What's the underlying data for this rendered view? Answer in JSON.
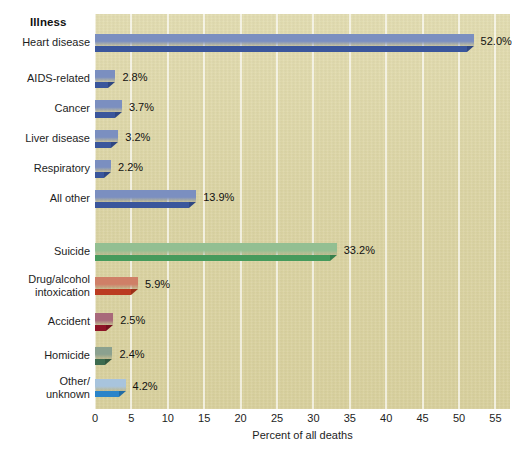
{
  "chart_data": {
    "type": "bar",
    "orientation": "horizontal",
    "title": "",
    "group_header": "Illness",
    "xlabel": "Percent of all deaths",
    "ylabel": "",
    "xlim": [
      0,
      57
    ],
    "xticks": [
      0,
      5,
      10,
      15,
      20,
      25,
      30,
      35,
      40,
      45,
      50,
      55
    ],
    "xtick_labels": [
      "0",
      "5",
      "10",
      "15",
      "20",
      "25",
      "30",
      "35",
      "40",
      "45",
      "50",
      "55"
    ],
    "grid": "vertical",
    "legend": "none",
    "categories": [
      "Heart disease",
      "AIDS-related",
      "Cancer",
      "Liver disease",
      "Respiratory",
      "All other",
      "Suicide",
      "Drug/alcohol intoxication",
      "Accident",
      "Homicide",
      "Other/ unknown"
    ],
    "values": [
      52.0,
      2.8,
      3.7,
      3.2,
      2.2,
      13.9,
      33.2,
      5.9,
      2.5,
      2.4,
      4.2
    ],
    "value_labels": [
      "52.0%",
      "2.8%",
      "3.7%",
      "3.2%",
      "2.2%",
      "13.9%",
      "33.2%",
      "5.9%",
      "2.5%",
      "2.4%",
      "4.2%"
    ],
    "bars": [
      {
        "label": "Heart disease",
        "label_lines": [
          "Heart disease"
        ],
        "value": 52.0,
        "value_label": "52.0%",
        "top_color": "#7b8fc0",
        "front_color": "#3a569c",
        "side_color": "#2f4782",
        "y": 34
      },
      {
        "label": "AIDS-related",
        "label_lines": [
          "AIDS-related"
        ],
        "value": 2.8,
        "value_label": "2.8%",
        "top_color": "#7b8fc0",
        "front_color": "#3a569c",
        "side_color": "#2f4782",
        "y": 70
      },
      {
        "label": "Cancer",
        "label_lines": [
          "Cancer"
        ],
        "value": 3.7,
        "value_label": "3.7%",
        "top_color": "#7b8fc0",
        "front_color": "#3a569c",
        "side_color": "#2f4782",
        "y": 100
      },
      {
        "label": "Liver disease",
        "label_lines": [
          "Liver disease"
        ],
        "value": 3.2,
        "value_label": "3.2%",
        "top_color": "#7b8fc0",
        "front_color": "#3a569c",
        "side_color": "#2f4782",
        "y": 130
      },
      {
        "label": "Respiratory",
        "label_lines": [
          "Respiratory"
        ],
        "value": 2.2,
        "value_label": "2.2%",
        "top_color": "#7b8fc0",
        "front_color": "#3a569c",
        "side_color": "#2f4782",
        "y": 160
      },
      {
        "label": "All other",
        "label_lines": [
          "All other"
        ],
        "value": 13.9,
        "value_label": "13.9%",
        "top_color": "#7b8fc0",
        "front_color": "#3a569c",
        "side_color": "#2f4782",
        "y": 190
      },
      {
        "label": "Suicide",
        "label_lines": [
          "Suicide"
        ],
        "value": 33.2,
        "value_label": "33.2%",
        "top_color": "#93bf92",
        "front_color": "#469a5c",
        "side_color": "#37804c",
        "y": 243
      },
      {
        "label": "Drug/alcohol intoxication",
        "label_lines": [
          "Drug/alcohol",
          "intoxication"
        ],
        "value": 5.9,
        "value_label": "5.9%",
        "top_color": "#cf7f67",
        "front_color": "#bb3b20",
        "side_color": "#9c2f18",
        "y": 277
      },
      {
        "label": "Accident",
        "label_lines": [
          "Accident"
        ],
        "value": 2.5,
        "value_label": "2.5%",
        "top_color": "#a8697a",
        "front_color": "#8e1426",
        "side_color": "#75101e",
        "y": 313
      },
      {
        "label": "Homicide",
        "label_lines": [
          "Homicide"
        ],
        "value": 2.4,
        "value_label": "2.4%",
        "top_color": "#8ba18f",
        "front_color": "#3d6b4f",
        "side_color": "#32583f",
        "y": 347
      },
      {
        "label": "Other/ unknown",
        "label_lines": [
          "Other/",
          "unknown"
        ],
        "value": 4.2,
        "value_label": "4.2%",
        "top_color": "#a8c4dd",
        "front_color": "#2b84c9",
        "side_color": "#226ca4",
        "y": 379
      }
    ],
    "colors": {
      "panel_background": "#ddd6a7",
      "gridline": "#ffffff",
      "text": "#1a1a1a",
      "blue_top": "#7b8fc0",
      "blue_front": "#3a569c",
      "green_top": "#93bf92",
      "green_front": "#469a5c",
      "orange_top": "#cf7f67",
      "orange_front": "#bb3b20",
      "maroon_top": "#a8697a",
      "maroon_front": "#8e1426",
      "darkgreen_top": "#8ba18f",
      "darkgreen_front": "#3d6b4f",
      "lightblue_top": "#a8c4dd",
      "lightblue_front": "#2b84c9"
    }
  }
}
